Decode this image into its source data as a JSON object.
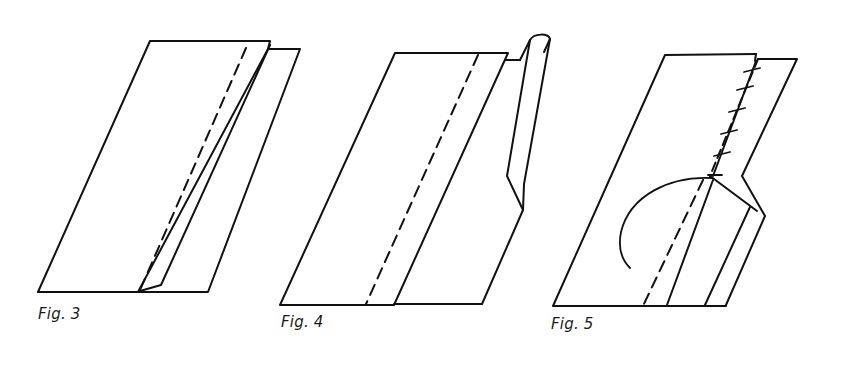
{
  "figures": [
    {
      "id": "fig3",
      "label": "Fig. 3"
    },
    {
      "id": "fig4",
      "label": "Fig. 4"
    },
    {
      "id": "fig5",
      "label": "Fig. 5"
    }
  ],
  "colors": {
    "ink": "#111111",
    "paper": "#ffffff"
  }
}
